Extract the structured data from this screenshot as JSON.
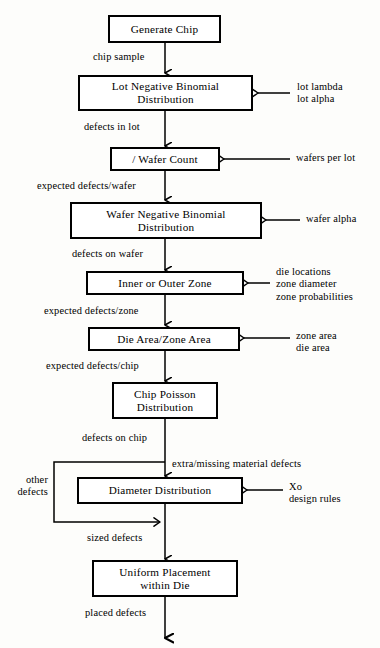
{
  "diagram": {
    "type": "flowchart",
    "orientation": "top-to-bottom",
    "line_color": "#000000",
    "background_color": "#fdfdfb"
  },
  "nodes": [
    {
      "id": "generate-chip",
      "label": "Generate Chip"
    },
    {
      "id": "lot-negative-binomial",
      "label": "Lot Negative Binomial\nDistribution"
    },
    {
      "id": "wafer-count",
      "label": "/ Wafer Count"
    },
    {
      "id": "wafer-negative-binomial",
      "label": "Wafer Negative Binomial\nDistribution"
    },
    {
      "id": "inner-or-outer-zone",
      "label": "Inner or Outer Zone"
    },
    {
      "id": "die-area-zone-area",
      "label": "Die Area/Zone Area"
    },
    {
      "id": "chip-poisson",
      "label": "Chip Poisson\nDistribution"
    },
    {
      "id": "diameter-distribution",
      "label": "Diameter Distribution"
    },
    {
      "id": "uniform-placement",
      "label": "Uniform Placement\nwithin Die"
    }
  ],
  "edge_labels": [
    {
      "id": "chip-sample",
      "text": "chip sample"
    },
    {
      "id": "defects-in-lot",
      "text": "defects in lot"
    },
    {
      "id": "expected-defects-wafer",
      "text": "expected defects/wafer"
    },
    {
      "id": "defects-on-wafer",
      "text": "defects on wafer"
    },
    {
      "id": "expected-defects-zone",
      "text": "expected defects/zone"
    },
    {
      "id": "expected-defects-chip",
      "text": "expected defects/chip"
    },
    {
      "id": "defects-on-chip",
      "text": "defects on chip"
    },
    {
      "id": "extra-missing-material-defects",
      "text": "extra/missing material defects"
    },
    {
      "id": "other-defects",
      "text": "other\ndefects"
    },
    {
      "id": "sized-defects",
      "text": "sized defects"
    },
    {
      "id": "placed-defects",
      "text": "placed defects"
    }
  ],
  "input_labels": [
    {
      "id": "lot-inputs",
      "text": "lot lambda\nlot alpha"
    },
    {
      "id": "wafers-per-lot",
      "text": "wafers per lot"
    },
    {
      "id": "wafer-alpha",
      "text": "wafer alpha"
    },
    {
      "id": "zone-inputs",
      "text": "die locations\nzone diameter\nzone probabilities"
    },
    {
      "id": "area-inputs",
      "text": "zone area\ndie area"
    },
    {
      "id": "diameter-inputs",
      "text": "Xo\ndesign rules"
    }
  ]
}
